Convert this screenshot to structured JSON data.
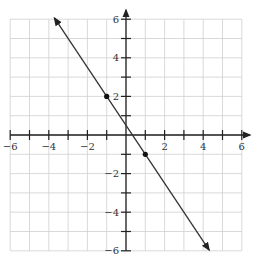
{
  "chart_data": {
    "type": "line",
    "title": "",
    "xlabel": "",
    "ylabel": "",
    "xlim": [
      -6,
      6
    ],
    "ylim": [
      -6,
      6
    ],
    "grid": true,
    "x_tick_labels": [
      "-6",
      "-4",
      "-2",
      "2",
      "4",
      "6"
    ],
    "y_tick_labels": [
      "6",
      "4",
      "2",
      "-2",
      "-4",
      "-6"
    ],
    "series": [
      {
        "name": "line",
        "equation": "y = -1.5x + 0.5",
        "slope": -1.5,
        "intercept": 0.5,
        "x_range": [
          -3.7,
          4.3
        ],
        "arrows_both_ends": true
      }
    ],
    "points": [
      {
        "x": -1,
        "y": 2
      },
      {
        "x": 1,
        "y": -1
      }
    ]
  },
  "colors": {
    "grid": "#cfcfcf",
    "axis": "#222222",
    "line": "#333333",
    "point": "#111111"
  }
}
